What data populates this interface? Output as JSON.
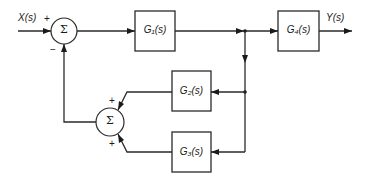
{
  "diagram": {
    "type": "control-system-block-diagram",
    "input": {
      "label": "X(s)"
    },
    "output": {
      "label": "Y(s)"
    },
    "summing_junctions": [
      {
        "id": "sum1",
        "symbol": "Σ",
        "signs": {
          "input": "+",
          "feedback": "−"
        }
      },
      {
        "id": "sum2",
        "symbol": "Σ",
        "signs": {
          "top": "+",
          "bottom": "+"
        }
      }
    ],
    "blocks": [
      {
        "id": "G1",
        "label": "G₁(s)",
        "name": "G",
        "sub": "1"
      },
      {
        "id": "G2",
        "label": "G₂(s)",
        "name": "G",
        "sub": "2"
      },
      {
        "id": "G3",
        "label": "G₃(s)",
        "name": "G",
        "sub": "3"
      },
      {
        "id": "G4",
        "label": "G₄(s)",
        "name": "G",
        "sub": "4"
      }
    ],
    "connections": [
      {
        "from": "X(s)",
        "to": "sum1",
        "sign": "+"
      },
      {
        "from": "sum1",
        "to": "G1"
      },
      {
        "from": "G1",
        "to": "G4"
      },
      {
        "from": "G4",
        "to": "Y(s)"
      },
      {
        "from": "G1-output-junction",
        "to": "G2"
      },
      {
        "from": "G1-output-junction",
        "to": "G3"
      },
      {
        "from": "G2",
        "to": "sum2",
        "sign": "+"
      },
      {
        "from": "G3",
        "to": "sum2",
        "sign": "+"
      },
      {
        "from": "sum2",
        "to": "sum1",
        "sign": "−"
      }
    ]
  }
}
